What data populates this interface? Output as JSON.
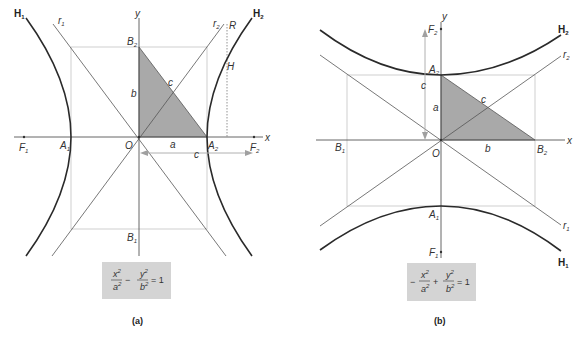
{
  "figure_a": {
    "caption": "(a)",
    "equation": {
      "num1": "x",
      "den1": "a",
      "op": "−",
      "num2": "y",
      "den2": "b",
      "rhs": "= 1",
      "exp": "2"
    },
    "labels": {
      "H1": "H",
      "H1_sub": "1",
      "H2": "H",
      "H2_sub": "2",
      "r1": "r",
      "r1_sub": "1",
      "r2": "r",
      "r2_sub": "2",
      "R": "R",
      "H": "H",
      "y": "y",
      "x": "x",
      "B2": "B",
      "B2_sub": "2",
      "B1": "B",
      "B1_sub": "1",
      "A1": "A",
      "A1_sub": "1",
      "A2": "A",
      "A2_sub": "2",
      "F1": "F",
      "F1_sub": "1",
      "F2": "F",
      "F2_sub": "2",
      "O": "O",
      "a": "a",
      "b": "b",
      "c_hyp": "c",
      "c_arrow": "c"
    }
  },
  "figure_b": {
    "caption": "(b)",
    "equation": {
      "sign": "−",
      "num1": "x",
      "den1": "a",
      "op": "+",
      "num2": "y",
      "den2": "b",
      "rhs": "= 1",
      "exp": "2"
    },
    "labels": {
      "H1": "H",
      "H1_sub": "1",
      "H2": "H",
      "H2_sub": "2",
      "r1": "r",
      "r1_sub": "1",
      "r2": "r",
      "r2_sub": "2",
      "y": "y",
      "x": "x",
      "A2": "A",
      "A2_sub": "2",
      "A1": "A",
      "A1_sub": "1",
      "B1": "B",
      "B1_sub": "1",
      "B2": "B",
      "B2_sub": "2",
      "F1": "F",
      "F1_sub": "1",
      "F2": "F",
      "F2_sub": "2",
      "O": "O",
      "a": "a",
      "b": "b",
      "c_hyp": "c",
      "c_arrow": "c"
    }
  },
  "colors": {
    "curve": "#2a2a2a",
    "line": "#555555",
    "rect": "#bbbbbb",
    "triangle": "#a9a9a9",
    "eqbox": "#d4d4d4",
    "arrow": "#a0a0a0"
  }
}
